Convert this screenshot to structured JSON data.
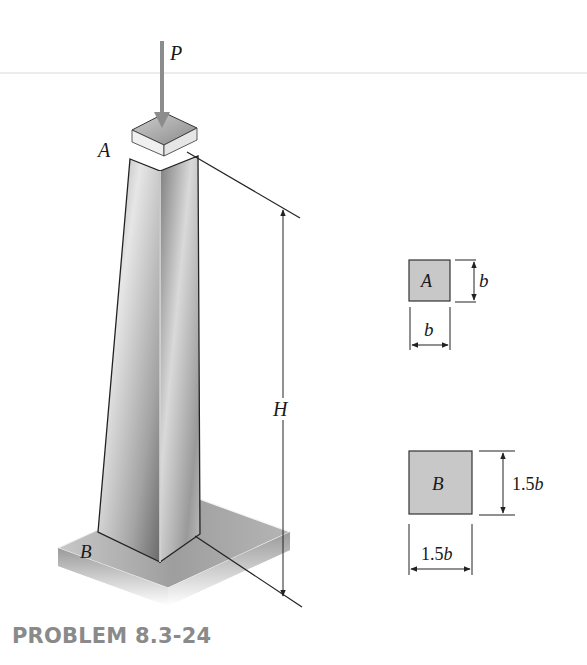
{
  "figure": {
    "type": "engineering-diagram",
    "labels": {
      "load": "P",
      "top_end": "A",
      "bottom_end": "B",
      "height": "H"
    },
    "cross_sections": [
      {
        "name": "section-A",
        "label": "A",
        "width_label": "b",
        "height_label": "b"
      },
      {
        "name": "section-B",
        "label": "B",
        "width_label_num": "1.5",
        "width_label_var": "b",
        "height_label_num": "1.5",
        "height_label_var": "b"
      }
    ],
    "colors": {
      "section_fill": "#c8c8c8",
      "load_arrow": "#888888",
      "lines": "#222222",
      "caption": "#8a8a8a"
    }
  },
  "caption": "PROBLEM 8.3-24"
}
